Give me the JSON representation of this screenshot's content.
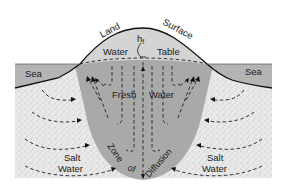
{
  "figure": {
    "type": "cross-section diagram",
    "colors": {
      "background": "#ffffff",
      "sea": "#b3b3b3",
      "salt_water_ground": "#e6e6e6",
      "fresh_water_lens": "#a8a8a8",
      "unsaturated_mound": "#d2d2d2",
      "lines": "#111111"
    }
  },
  "labels": {
    "land": "Land",
    "surface": "Surface",
    "h_f": "h",
    "h_f_sub": "f",
    "water": "Water",
    "table": "Table",
    "sea_left": "Sea",
    "sea_right": "Sea",
    "fresh": "Fresh",
    "fresh_water": "Water",
    "salt_left_1": "Salt",
    "salt_left_2": "Water",
    "salt_right_1": "Salt",
    "salt_right_2": "Water",
    "zone": "Zone",
    "of": "of",
    "diffusion": "Diffusion"
  }
}
